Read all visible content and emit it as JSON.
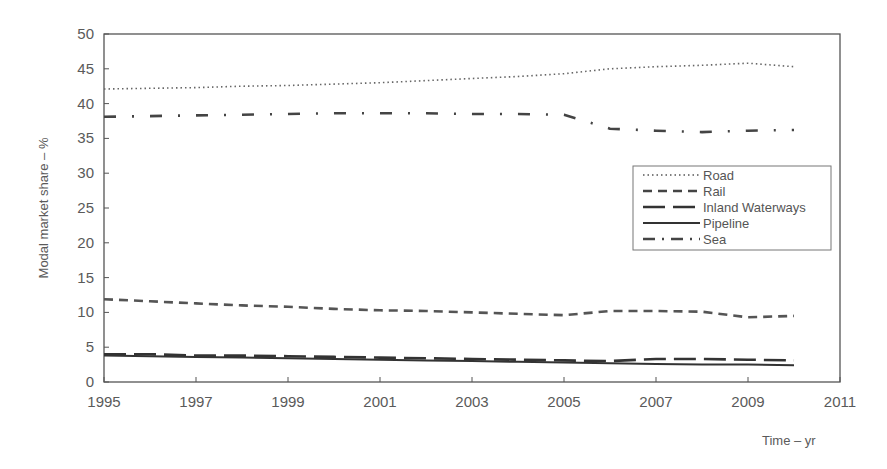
{
  "chart_data": {
    "type": "line",
    "title": "",
    "xlabel": "Time – yr",
    "ylabel": "Modal market share – %",
    "xlim": [
      1995,
      2011
    ],
    "ylim": [
      0,
      50
    ],
    "xticks": [
      1995,
      1997,
      1999,
      2001,
      2003,
      2005,
      2007,
      2009,
      2011
    ],
    "xtick_labels": [
      "1995",
      "1997",
      "1999",
      "2001",
      "2003",
      "2005",
      "2007",
      "2009",
      "2011"
    ],
    "yticks": [
      0,
      5,
      10,
      15,
      20,
      25,
      30,
      35,
      40,
      45,
      50
    ],
    "grid": false,
    "legend_position": "right-center",
    "x": [
      1995,
      1996,
      1997,
      1998,
      1999,
      2000,
      2001,
      2002,
      2003,
      2004,
      2005,
      2006,
      2007,
      2008,
      2009,
      2010
    ],
    "series": [
      {
        "name": "Road",
        "style": "dotted",
        "values": [
          42.1,
          42.2,
          42.3,
          42.5,
          42.6,
          42.8,
          43.0,
          43.3,
          43.6,
          43.9,
          44.3,
          45.0,
          45.3,
          45.5,
          45.8,
          45.3
        ]
      },
      {
        "name": "Rail",
        "style": "dashed",
        "values": [
          11.9,
          11.6,
          11.3,
          11.0,
          10.8,
          10.5,
          10.3,
          10.2,
          10.0,
          9.8,
          9.6,
          10.2,
          10.2,
          10.1,
          9.3,
          9.5
        ]
      },
      {
        "name": "Inland Waterways",
        "style": "long-dashed",
        "values": [
          4.0,
          4.0,
          3.8,
          3.8,
          3.7,
          3.6,
          3.5,
          3.4,
          3.3,
          3.2,
          3.1,
          3.0,
          3.3,
          3.3,
          3.2,
          3.1
        ]
      },
      {
        "name": "Pipeline",
        "style": "solid",
        "values": [
          3.8,
          3.7,
          3.6,
          3.5,
          3.4,
          3.3,
          3.2,
          3.1,
          3.0,
          2.9,
          2.8,
          2.7,
          2.6,
          2.5,
          2.5,
          2.4
        ]
      },
      {
        "name": "Sea",
        "style": "dash-dot",
        "values": [
          38.1,
          38.2,
          38.3,
          38.4,
          38.5,
          38.6,
          38.6,
          38.6,
          38.5,
          38.5,
          38.4,
          36.4,
          36.1,
          35.9,
          36.1,
          36.2
        ]
      }
    ]
  },
  "legend": {
    "items": [
      "Road",
      "Rail",
      "Inland Waterways",
      "Pipeline",
      "Sea"
    ]
  },
  "colors": {
    "line": "#444444",
    "axis": "#555555",
    "text": "#5a5a5a"
  }
}
